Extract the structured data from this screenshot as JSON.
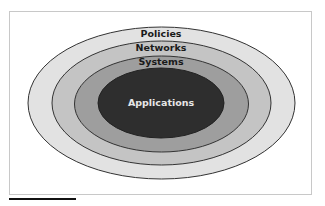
{
  "diagram": {
    "layers": [
      {
        "label": "Policies",
        "fill": "#e2e2e2",
        "text_color": "#1a1a1a"
      },
      {
        "label": "Networks",
        "fill": "#c4c4c4",
        "text_color": "#1a1a1a"
      },
      {
        "label": "Systems",
        "fill": "#9e9e9e",
        "text_color": "#1a1a1a"
      },
      {
        "label": "Applications",
        "fill": "#2e2e2e",
        "text_color": "#e6e6e6"
      }
    ],
    "outline_color": "#333333"
  }
}
